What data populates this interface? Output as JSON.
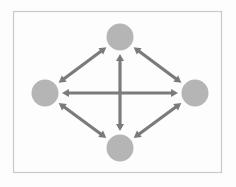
{
  "figure": {
    "width": 236,
    "height": 187,
    "background_color": "#fdfdfd",
    "frame": {
      "x": 13.5,
      "y": 11.5,
      "width": 208,
      "height": 161,
      "stroke_color": "#c9c9c9",
      "stroke_width": 1.2,
      "fill_color": "#fdfdfd"
    },
    "node_style": {
      "fill_color": "#b5b5b5",
      "radius": 13.5
    },
    "edge_style": {
      "stroke_color": "#7b7b7b",
      "stroke_width": 3.2,
      "arrowhead": "double",
      "arrowhead_length": 7,
      "arrowhead_width": 8
    },
    "nodes": [
      {
        "id": "top",
        "label": "",
        "cx": 120,
        "cy": 37,
        "r": 13.5
      },
      {
        "id": "left",
        "label": "",
        "cx": 45,
        "cy": 93,
        "r": 13.5
      },
      {
        "id": "right",
        "label": "",
        "cx": 195,
        "cy": 93,
        "r": 13.5
      },
      {
        "id": "bottom",
        "label": "",
        "cx": 120,
        "cy": 148,
        "r": 13.5
      }
    ],
    "edges": [
      {
        "id": "left-top",
        "from": "left",
        "to": "top",
        "bidirectional": true
      },
      {
        "id": "top-right",
        "from": "top",
        "to": "right",
        "bidirectional": true
      },
      {
        "id": "left-bottom",
        "from": "left",
        "to": "bottom",
        "bidirectional": true
      },
      {
        "id": "bottom-right",
        "from": "bottom",
        "to": "right",
        "bidirectional": true
      },
      {
        "id": "left-right",
        "from": "left",
        "to": "right",
        "bidirectional": true
      },
      {
        "id": "top-bottom",
        "from": "top",
        "to": "bottom",
        "bidirectional": true
      }
    ],
    "edge_count": 6,
    "node_count": 4
  }
}
